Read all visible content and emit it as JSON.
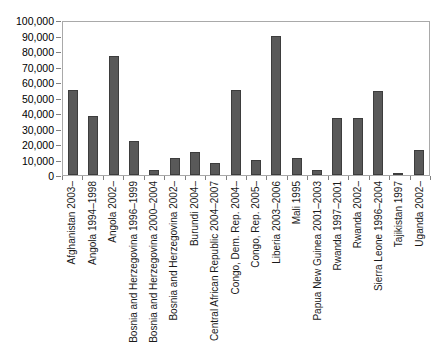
{
  "chart_data": {
    "type": "bar",
    "title": "",
    "xlabel": "",
    "ylabel": "",
    "ylim": [
      0,
      100000
    ],
    "grid": false,
    "legend": "none",
    "bar_color": "#595959",
    "y_ticks": [
      "100,000",
      "90,000",
      "80,000",
      "70,000",
      "60,000",
      "50,000",
      "40,000",
      "30,000",
      "20,000",
      "10,000",
      "0"
    ],
    "y_tick_values": [
      100000,
      90000,
      80000,
      70000,
      60000,
      50000,
      40000,
      30000,
      20000,
      10000,
      0
    ],
    "categories": [
      "Afghanistan 2003–",
      "Angola 1994–1998",
      "Angola 2002–",
      "Bosnia and Herzegovina 1996–1999",
      "Bosnia and Herzegovina 2000–2004",
      "Bosnia and Herzegovina 2002–",
      "Burundi 2004–",
      "Central African Republic 2004–2007",
      "Congo, Dem. Rep. 2004–",
      "Congo, Rep. 2005–",
      "Liberia 2003–2006",
      "Mali 1995",
      "Papua New Guinea 2001–2003",
      "Rwanda 1997–2001",
      "Rwanda 2002–",
      "Sierra Leone 1996–2004",
      "Tajikistan 1997",
      "Uganda 2002–"
    ],
    "values": [
      55000,
      38000,
      77000,
      22000,
      3500,
      11000,
      15000,
      8000,
      55000,
      10000,
      90000,
      11000,
      3000,
      37000,
      37000,
      54000,
      700,
      16000
    ]
  }
}
